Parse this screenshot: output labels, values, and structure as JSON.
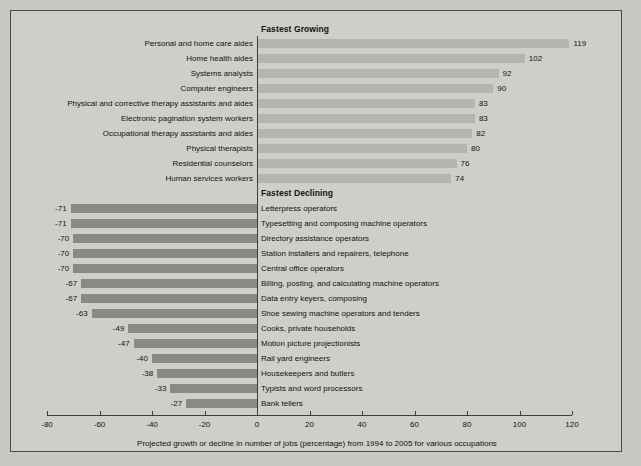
{
  "figure": {
    "axis_caption": "Projected growth or decline in number of jobs (percentage) from 1994 to 2005 for various occupations",
    "growing_header": "Fastest Growing",
    "declining_header": "Fastest Declining",
    "colors": {
      "page_background": "#c9c9c4",
      "panel_background": "#cfcfca",
      "frame_border": "#4a4a4a",
      "growing_bar": "#b4b4b0",
      "declining_bar": "#898985",
      "axis": "#3d3d3d",
      "text": "#111111"
    }
  },
  "chart_data": {
    "type": "bar",
    "orientation": "horizontal",
    "title": "",
    "subtitle": "",
    "xlabel": "Projected growth or decline in number of jobs (percentage) from 1994 to 2005 for various occupations",
    "ylabel": "",
    "xlim": [
      -80,
      120
    ],
    "xticks": [
      -80,
      -60,
      -40,
      -20,
      0,
      20,
      40,
      60,
      80,
      100,
      120
    ],
    "xtick_labels": [
      "-80",
      "-60",
      "-40",
      "-20",
      "0",
      "20",
      "40",
      "60",
      "80",
      "100",
      "120"
    ],
    "grid": false,
    "legend": null,
    "groups": [
      {
        "name": "Fastest Growing",
        "categories": [
          "Personal and home care aides",
          "Home health aides",
          "Systems analysts",
          "Computer engineers",
          "Physical and corrective therapy assistants and aides",
          "Electronic pagination system workers",
          "Occupational therapy assistants and aides",
          "Physical therapists",
          "Residential counselors",
          "Human services workers"
        ],
        "values": [
          119,
          102,
          92,
          90,
          83,
          83,
          82,
          80,
          76,
          74
        ],
        "value_labels": [
          "119",
          "102",
          "92",
          "90",
          "83",
          "83",
          "82",
          "80",
          "76",
          "74"
        ]
      },
      {
        "name": "Fastest Declining",
        "categories": [
          "Letterpress operators",
          "Typesetting and composing machine operators",
          "Directory assistance operators",
          "Station installers and repairers, telephone",
          "Central office operators",
          "Billing, posting, and calculating machine operators",
          "Data entry keyers, composing",
          "Shoe sewing machine operators and tenders",
          "Cooks, private households",
          "Motion picture projectionists",
          "Rail yard engineers",
          "Housekeepers and butlers",
          "Typists and word processors",
          "Bank tellers"
        ],
        "values": [
          -71,
          -71,
          -70,
          -70,
          -70,
          -67,
          -67,
          -63,
          -49,
          -47,
          -40,
          -38,
          -33,
          -27
        ],
        "value_labels": [
          "-71",
          "-71",
          "-70",
          "-70",
          "-70",
          "-67",
          "-67",
          "-63",
          "-49",
          "-47",
          "-40",
          "-38",
          "-33",
          "-27"
        ]
      }
    ]
  }
}
